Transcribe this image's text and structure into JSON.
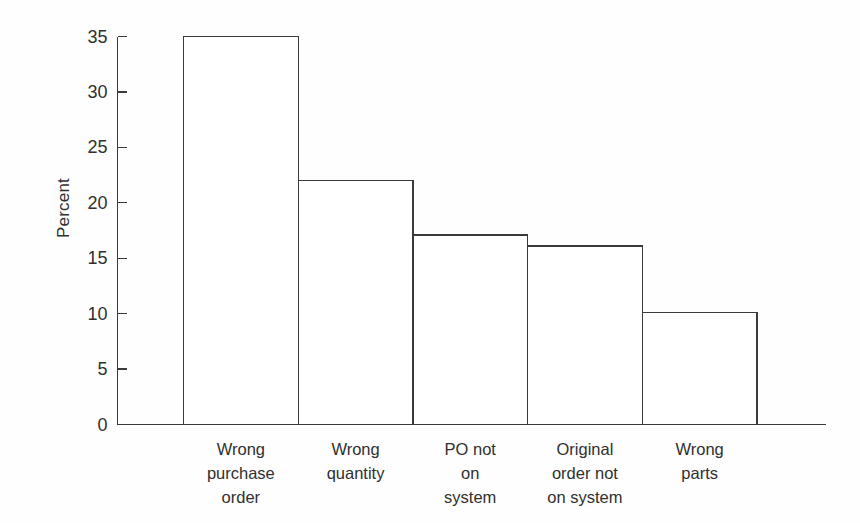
{
  "chart_data": {
    "type": "bar",
    "title": "",
    "subtitle": "",
    "xlabel": "",
    "ylabel": "Percent",
    "categories": [
      "Wrong\npurchase\norder",
      "Wrong\nquantity",
      "PO not\non\nsystem",
      "Original\norder not\non system",
      "Wrong\nparts"
    ],
    "categories_flat": [
      "Wrong purchase order",
      "Wrong quantity",
      "PO not on system",
      "Original order not on system",
      "Wrong parts"
    ],
    "values": [
      35,
      22,
      17.1,
      16.1,
      10.1
    ],
    "ylim": [
      0,
      35
    ],
    "yticks": [
      0,
      5,
      10,
      15,
      20,
      25,
      30,
      35
    ],
    "ytick_labels": [
      "0",
      "5",
      "10",
      "15",
      "20",
      "25",
      "30",
      "35"
    ],
    "grid": false,
    "legend": false,
    "legend_position": "none",
    "bar_style": "outlined",
    "bar_fill": "#ffffff",
    "bar_edge_color": "#3a3a3a",
    "axis_color": "#3a3a3a",
    "text_color": "#303030",
    "background": "#fefefe",
    "annotations": []
  },
  "axes": {
    "y_title": "Percent"
  }
}
